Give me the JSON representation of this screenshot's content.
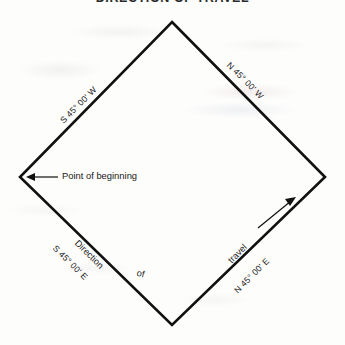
{
  "document": {
    "title": "DIRECTION OF TRAVEL",
    "type": "survey-plat-diagram"
  },
  "figure": {
    "shape": "diamond",
    "vertices": {
      "north": {
        "x": 172,
        "y": 22
      },
      "east": {
        "x": 325,
        "y": 177
      },
      "south": {
        "x": 172,
        "y": 325
      },
      "west": {
        "x": 20,
        "y": 177
      }
    },
    "line_color": "#111111"
  },
  "bearings": [
    {
      "id": "northwest-edge",
      "label": "S 45° 00' W",
      "position": "upper-left",
      "rotation": -45,
      "x": 58,
      "y": 118
    },
    {
      "id": "northeast-edge",
      "label": "N 45° 00' W",
      "position": "upper-right",
      "rotation": 45,
      "x": 232,
      "y": 60
    },
    {
      "id": "southwest-edge",
      "label": "S 45° 00' E",
      "position": "lower-left",
      "rotation": 45,
      "x": 58,
      "y": 243
    },
    {
      "id": "southeast-edge",
      "label": "N 45° 00' E",
      "position": "lower-right",
      "rotation": -45,
      "x": 232,
      "y": 288
    }
  ],
  "annotations": {
    "point_of_beginning": {
      "label": "Point of beginning",
      "arrow": "arrow-left",
      "target_vertex": "west"
    },
    "direction_of_travel": {
      "words": [
        {
          "text": "Direction",
          "rotation": 45,
          "x": 80,
          "y": 238
        },
        {
          "text": "of",
          "rotation": 12,
          "x": 138,
          "y": 268
        },
        {
          "text": "travel",
          "rotation": -45,
          "x": 226,
          "y": 258
        }
      ],
      "arrow": "arrow-up-right",
      "arrow_meaning": "direction of travel along southeast edge"
    }
  },
  "colors": {
    "ink": "#111111",
    "paper": "#fdfdfc",
    "title": "#2b2b2b"
  }
}
